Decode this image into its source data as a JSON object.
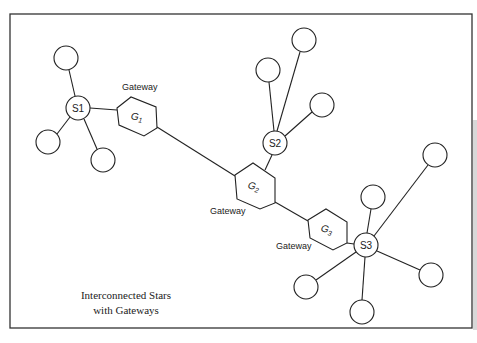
{
  "title": {
    "line1": "Interconnected Stars",
    "line2": "with Gateways"
  },
  "colors": {
    "stroke": "#222222",
    "background": "#ffffff",
    "text": "#222222"
  },
  "stars": [
    {
      "id": "S1",
      "label": "S1",
      "x": 78,
      "y": 108,
      "r": 12,
      "leaves": [
        {
          "x": 66,
          "y": 58
        },
        {
          "x": 48,
          "y": 142
        },
        {
          "x": 103,
          "y": 160
        }
      ]
    },
    {
      "id": "S2",
      "label": "S2",
      "x": 275,
      "y": 143,
      "r": 12,
      "leaves": [
        {
          "x": 268,
          "y": 70
        },
        {
          "x": 304,
          "y": 40
        },
        {
          "x": 322,
          "y": 105
        }
      ]
    },
    {
      "id": "S3",
      "label": "S3",
      "x": 366,
      "y": 245,
      "r": 12,
      "leaves": [
        {
          "x": 373,
          "y": 197
        },
        {
          "x": 435,
          "y": 155
        },
        {
          "x": 431,
          "y": 275
        },
        {
          "x": 306,
          "y": 287
        },
        {
          "x": 362,
          "y": 312
        }
      ]
    }
  ],
  "gateways": [
    {
      "id": "G1",
      "label": "G",
      "sub": "1",
      "caption": "Gateway",
      "cx": 137,
      "cy": 116,
      "caption_x": 122,
      "caption_y": 90
    },
    {
      "id": "G2",
      "label": "G",
      "sub": "2",
      "caption": "Gateway",
      "cx": 255,
      "cy": 186,
      "caption_x": 210,
      "caption_y": 214
    },
    {
      "id": "G3",
      "label": "G",
      "sub": "3",
      "caption": "Gateway",
      "cx": 328,
      "cy": 229,
      "caption_x": 276,
      "caption_y": 249
    }
  ],
  "links": [
    {
      "from": "S1",
      "to": "G1"
    },
    {
      "from": "G1",
      "to": "G2"
    },
    {
      "from": "G2",
      "to": "S2"
    },
    {
      "from": "G2",
      "to": "G3"
    },
    {
      "from": "G3",
      "to": "S3"
    }
  ]
}
